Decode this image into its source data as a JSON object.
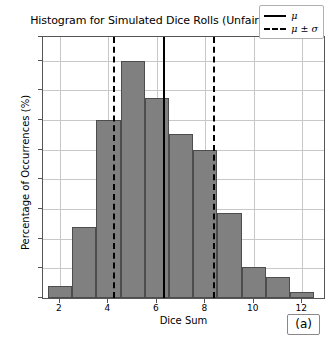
{
  "chart_data": {
    "type": "bar",
    "title": "Histogram for Simulated Dice Rolls (Unfair, Small)",
    "xlabel": "Dice Sum",
    "ylabel": "Percentage of Occurrences (%)",
    "categories": [
      2,
      3,
      4,
      5,
      6,
      7,
      8,
      9,
      10,
      11,
      12
    ],
    "values": [
      1.0,
      6.0,
      15.0,
      20.0,
      16.9,
      13.8,
      12.5,
      7.2,
      2.6,
      1.8,
      0.5
    ],
    "xlim": [
      1.3,
      12.9
    ],
    "ylim": [
      0,
      22
    ],
    "xticks": [
      2,
      4,
      6,
      8,
      10,
      12
    ],
    "yticks": [
      0,
      2,
      5,
      7,
      10,
      12,
      15,
      17,
      20,
      22
    ],
    "ytick_values": [
      0,
      2.5,
      5,
      7.5,
      10,
      12.5,
      15,
      17.5,
      20,
      22
    ],
    "grid": true,
    "legend_position": "upper right",
    "annotations": [
      {
        "name": "mu-line",
        "type": "vline",
        "x": 6.25,
        "style": "solid",
        "color": "#000000"
      },
      {
        "name": "mu-minus-sigma-line",
        "type": "vline",
        "x": 4.2,
        "style": "dashed",
        "color": "#000000"
      },
      {
        "name": "mu-plus-sigma-line",
        "type": "vline",
        "x": 8.3,
        "style": "dashed",
        "color": "#000000"
      }
    ],
    "legend": [
      {
        "label": "μ",
        "style": "solid"
      },
      {
        "label": "μ ± σ",
        "style": "dashed"
      }
    ],
    "panel_label": "(a)",
    "bar_color": "#808080",
    "bar_edge_color": "#4d4d4d",
    "grid_color": "#c8c8c8"
  }
}
